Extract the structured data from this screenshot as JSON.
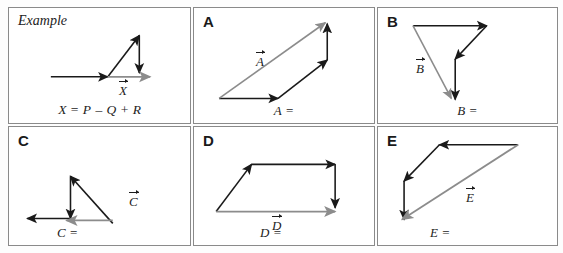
{
  "page": {
    "background_color": "#ffffff",
    "border_color": "#8a8a8a",
    "vector_black": "#1a1a1a",
    "vector_gray": "#8c8c8c"
  },
  "cells": [
    {
      "id": "example",
      "label": "Example",
      "label_style": "italic",
      "resultant_label": "X",
      "answer_text": "X",
      "equation": {
        "lhs": "X",
        "terms": [
          "P",
          "Q",
          "R"
        ],
        "ops": [
          "=",
          "–",
          "+"
        ],
        "full_text": "X = P – Q + R"
      },
      "vectors": [
        {
          "name": "P",
          "color": "black",
          "from": [
            42,
            70
          ],
          "to": [
            100,
            70
          ]
        },
        {
          "name": "Q",
          "color": "black",
          "from": [
            100,
            70
          ],
          "to": [
            132,
            28
          ]
        },
        {
          "name": "R",
          "color": "black",
          "from": [
            132,
            28
          ],
          "to": [
            132,
            66
          ]
        },
        {
          "name": "X",
          "color": "gray",
          "from": [
            100,
            70
          ],
          "to": [
            143,
            70
          ]
        }
      ]
    },
    {
      "id": "A",
      "label": "A",
      "label_style": "bold",
      "resultant_label": "A",
      "answer_text": "A",
      "vectors": [
        {
          "name": "A1",
          "color": "black",
          "from": [
            25,
            92
          ],
          "to": [
            85,
            92
          ]
        },
        {
          "name": "A2",
          "color": "black",
          "from": [
            85,
            92
          ],
          "to": [
            135,
            53
          ]
        },
        {
          "name": "A3",
          "color": "black",
          "from": [
            135,
            53
          ],
          "to": [
            135,
            16
          ]
        },
        {
          "name": "A",
          "color": "gray",
          "from": [
            25,
            92
          ],
          "to": [
            133,
            15
          ]
        }
      ]
    },
    {
      "id": "B",
      "label": "B",
      "label_style": "bold",
      "resultant_label": "B",
      "answer_text": "B",
      "vectors": [
        {
          "name": "B1",
          "color": "black",
          "from": [
            35,
            18
          ],
          "to": [
            110,
            18
          ]
        },
        {
          "name": "B2",
          "color": "black",
          "from": [
            110,
            18
          ],
          "to": [
            78,
            52
          ]
        },
        {
          "name": "B3",
          "color": "black",
          "from": [
            78,
            52
          ],
          "to": [
            78,
            93
          ]
        },
        {
          "name": "B",
          "color": "gray",
          "from": [
            35,
            18
          ],
          "to": [
            74,
            92
          ]
        }
      ]
    },
    {
      "id": "C",
      "label": "C",
      "label_style": "bold",
      "resultant_label": "C",
      "answer_text": "C",
      "vectors": [
        {
          "name": "C1",
          "color": "black",
          "from": [
            105,
            98
          ],
          "to": [
            62,
            50
          ]
        },
        {
          "name": "C2",
          "color": "black",
          "from": [
            62,
            50
          ],
          "to": [
            62,
            93
          ]
        },
        {
          "name": "C3",
          "color": "black",
          "from": [
            62,
            93
          ],
          "to": [
            18,
            93
          ]
        },
        {
          "name": "C",
          "color": "gray",
          "from": [
            105,
            95
          ],
          "to": [
            58,
            95
          ]
        }
      ]
    },
    {
      "id": "D",
      "label": "D",
      "label_style": "bold",
      "resultant_label": "D",
      "answer_text": "D",
      "vectors": [
        {
          "name": "D1",
          "color": "black",
          "from": [
            22,
            86
          ],
          "to": [
            58,
            38
          ]
        },
        {
          "name": "D2",
          "color": "black",
          "from": [
            58,
            38
          ],
          "to": [
            143,
            38
          ]
        },
        {
          "name": "D3",
          "color": "black",
          "from": [
            143,
            38
          ],
          "to": [
            143,
            82
          ]
        },
        {
          "name": "D",
          "color": "gray",
          "from": [
            22,
            86
          ],
          "to": [
            143,
            86
          ]
        }
      ]
    },
    {
      "id": "E",
      "label": "E",
      "label_style": "bold",
      "resultant_label": "E",
      "answer_text": "E",
      "vectors": [
        {
          "name": "E1",
          "color": "black",
          "from": [
            142,
            18
          ],
          "to": [
            62,
            18
          ]
        },
        {
          "name": "E2",
          "color": "black",
          "from": [
            62,
            18
          ],
          "to": [
            26,
            55
          ]
        },
        {
          "name": "E3",
          "color": "black",
          "from": [
            26,
            55
          ],
          "to": [
            26,
            94
          ]
        },
        {
          "name": "E",
          "color": "gray",
          "from": [
            142,
            18
          ],
          "to": [
            24,
            94
          ]
        }
      ]
    }
  ]
}
